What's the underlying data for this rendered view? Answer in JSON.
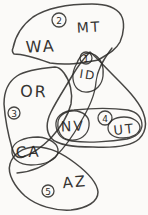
{
  "diagram": {
    "paper_color": "#fbfaf8",
    "ink_color": "#2e2c2a",
    "state_labels": [
      {
        "id": "wa",
        "text": "WA"
      },
      {
        "id": "mt",
        "text": "MT"
      },
      {
        "id": "or",
        "text": "OR"
      },
      {
        "id": "id",
        "text": "ID"
      },
      {
        "id": "nv",
        "text": "NV"
      },
      {
        "id": "ut",
        "text": "UT"
      },
      {
        "id": "ca",
        "text": "CA"
      },
      {
        "id": "az",
        "text": "AZ"
      }
    ],
    "markers": [
      {
        "id": "m1",
        "text": "1"
      },
      {
        "id": "m2",
        "text": "2"
      },
      {
        "id": "m3",
        "text": "3"
      },
      {
        "id": "m4",
        "text": "4"
      },
      {
        "id": "m5",
        "text": "5"
      }
    ],
    "groups": [
      {
        "marker": "2",
        "states": [
          "WA",
          "MT"
        ]
      },
      {
        "marker": "1",
        "states": [
          "ID"
        ]
      },
      {
        "marker": "3",
        "states": [
          "OR"
        ]
      },
      {
        "marker": "4",
        "states": [
          "NV",
          "UT"
        ]
      },
      {
        "marker": "5",
        "states": [
          "CA",
          "AZ"
        ]
      }
    ]
  }
}
